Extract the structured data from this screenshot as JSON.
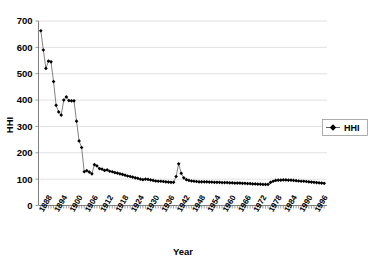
{
  "chart_data": {
    "type": "line",
    "title": "",
    "xlabel": "Year",
    "ylabel": "HHI",
    "ylim": [
      0,
      700
    ],
    "yticks": [
      0,
      100,
      200,
      300,
      400,
      500,
      600,
      700
    ],
    "grid": true,
    "legend_position": "right",
    "legend": [
      "HHI"
    ],
    "marker": "filled-diamond",
    "xlim": [
      1888,
      1999
    ],
    "xtick_labels": [
      "1888",
      "1894",
      "1900",
      "1906",
      "1912",
      "1918",
      "1924",
      "1930",
      "1936",
      "1942",
      "1948",
      "1954",
      "1960",
      "1966",
      "1972",
      "1978",
      "1984",
      "1990",
      "1996"
    ],
    "xtick_step": 6,
    "series": [
      {
        "name": "HHI",
        "x": [
          1888,
          1889,
          1890,
          1891,
          1892,
          1893,
          1894,
          1895,
          1896,
          1897,
          1898,
          1899,
          1900,
          1901,
          1902,
          1903,
          1904,
          1905,
          1906,
          1907,
          1908,
          1909,
          1910,
          1911,
          1912,
          1913,
          1914,
          1915,
          1916,
          1917,
          1918,
          1919,
          1920,
          1921,
          1922,
          1923,
          1924,
          1925,
          1926,
          1927,
          1928,
          1929,
          1930,
          1931,
          1932,
          1933,
          1934,
          1935,
          1936,
          1937,
          1938,
          1939,
          1940,
          1941,
          1942,
          1943,
          1944,
          1945,
          1946,
          1947,
          1948,
          1949,
          1950,
          1951,
          1952,
          1953,
          1954,
          1955,
          1956,
          1957,
          1958,
          1959,
          1960,
          1961,
          1962,
          1963,
          1964,
          1965,
          1966,
          1967,
          1968,
          1969,
          1970,
          1971,
          1972,
          1973,
          1974,
          1975,
          1976,
          1977,
          1978,
          1979,
          1980,
          1981,
          1982,
          1983,
          1984,
          1985,
          1986,
          1987,
          1988,
          1989,
          1990,
          1991,
          1992,
          1993,
          1994,
          1995,
          1996,
          1997,
          1998,
          1999
        ],
        "values": [
          663,
          590,
          520,
          548,
          545,
          470,
          380,
          355,
          343,
          400,
          412,
          398,
          397,
          397,
          320,
          245,
          220,
          128,
          132,
          127,
          120,
          155,
          150,
          140,
          138,
          133,
          135,
          130,
          128,
          125,
          123,
          120,
          118,
          115,
          112,
          110,
          108,
          105,
          103,
          100,
          98,
          100,
          99,
          97,
          95,
          93,
          92,
          92,
          91,
          90,
          89,
          88,
          88,
          110,
          158,
          122,
          105,
          98,
          95,
          93,
          92,
          91,
          90,
          90,
          90,
          90,
          89,
          89,
          88,
          88,
          88,
          87,
          87,
          87,
          86,
          86,
          85,
          85,
          85,
          84,
          84,
          83,
          83,
          82,
          82,
          81,
          81,
          80,
          80,
          80,
          88,
          92,
          95,
          96,
          96,
          97,
          97,
          96,
          96,
          95,
          94,
          93,
          92,
          92,
          91,
          90,
          89,
          88,
          87,
          86,
          85,
          84
        ]
      }
    ]
  },
  "legend": {
    "label": "HHI"
  },
  "axes": {
    "y_title": "HHI",
    "x_title": "Year"
  }
}
